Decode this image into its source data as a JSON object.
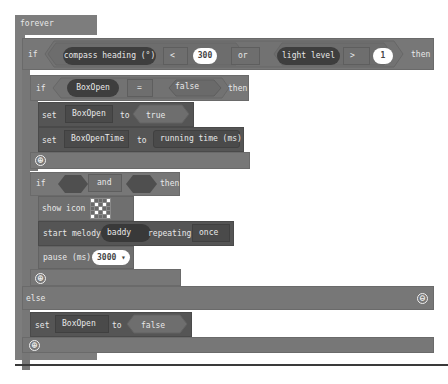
{
  "forever": {
    "label": "forever"
  },
  "outer_if": {
    "if_label": "if",
    "left_cond": {
      "sensor": "compass heading (°)",
      "op": "<",
      "value": "300"
    },
    "joiner": "or",
    "right_cond": {
      "sensor": "light level",
      "op": ">",
      "value": "1"
    },
    "then_label": "then"
  },
  "inner_if1": {
    "if_label": "if",
    "var": "BoxOpen",
    "op": "=",
    "value": "false",
    "then_label": "then",
    "body": [
      {
        "set_label": "set",
        "var": "BoxOpen",
        "to_label": "to",
        "value": "true"
      },
      {
        "set_label": "set",
        "var": "BoxOpenTime",
        "to_label": "to",
        "value": "running time (ms)"
      }
    ]
  },
  "inner_if2": {
    "if_label": "if",
    "joiner": "and",
    "then_label": "then",
    "show_icon": {
      "label": "show icon",
      "icon": "skull-pattern-icon"
    },
    "melody": {
      "label": "start melody",
      "melody": "baddy",
      "repeating_label": "repeating",
      "repeat": "once"
    },
    "pause": {
      "label": "pause (ms)",
      "value": "3000",
      "dropdown_glyph": "▾"
    }
  },
  "else_branch": {
    "else_label": "else",
    "set_label": "set",
    "var": "BoxOpen",
    "to_label": "to",
    "value": "false"
  },
  "icons": {
    "add": "⊕",
    "remove": "⊖"
  },
  "led_pattern": [
    [
      1,
      0,
      0,
      0,
      1
    ],
    [
      0,
      1,
      0,
      1,
      0
    ],
    [
      0,
      0,
      1,
      0,
      0
    ],
    [
      0,
      1,
      0,
      1,
      0
    ],
    [
      1,
      0,
      0,
      0,
      1
    ]
  ]
}
